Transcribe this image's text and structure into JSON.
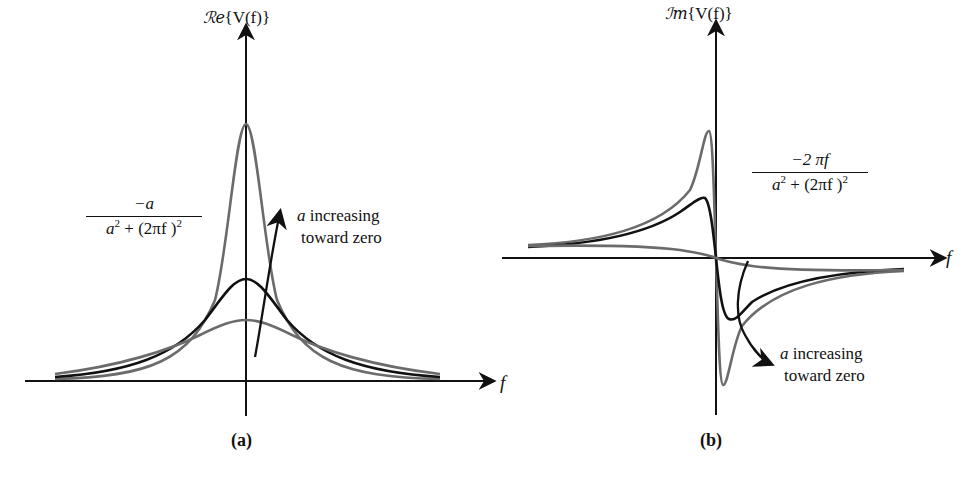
{
  "panel_a": {
    "y_axis_label_prefix": "ℛe",
    "y_axis_label_body": "{V(f)}",
    "x_axis_label": "f",
    "formula": {
      "numerator": "−a",
      "denominator_pre": "a",
      "denominator_exp1": "2",
      "denominator_mid": " + (2πf )",
      "denominator_exp2": "2"
    },
    "annotation_line1_var": "a",
    "annotation_line1_rest": " increasing",
    "annotation_line2": "toward zero",
    "caption": "(a)"
  },
  "panel_b": {
    "y_axis_label_prefix": "ℐm",
    "y_axis_label_body": "{V(f)}",
    "x_axis_label": "f",
    "formula": {
      "numerator": "−2 πf",
      "denominator_pre": "a",
      "denominator_exp1": "2",
      "denominator_mid": " + (2πf )",
      "denominator_exp2": "2"
    },
    "annotation_line1_var": "a",
    "annotation_line1_rest": " increasing",
    "annotation_line2": "toward zero",
    "caption": "(b)"
  },
  "colors": {
    "axis": "#111111",
    "curve_dark": "#111111",
    "curve_gray": "#6b6b6b"
  }
}
